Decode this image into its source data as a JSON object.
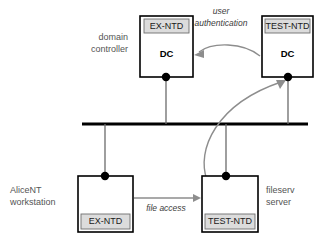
{
  "diagram": {
    "colors": {
      "band_fill": "#dcdcdc",
      "box_stroke": "#000000",
      "bus_line": "#000000",
      "arrow_gray": "#8d8d8d",
      "label_gray": "#545454",
      "background": "#ffffff"
    },
    "nodes": [
      {
        "id": "dc-left",
        "band_label": "EX-NTD",
        "role_label": "DC",
        "band_position": "top",
        "side_label": "domain controller",
        "side_label_lines": [
          "domain",
          "controller"
        ],
        "side_label_position": "left"
      },
      {
        "id": "dc-right",
        "band_label": "TEST-NTD",
        "role_label": "DC",
        "band_position": "top",
        "side_label": "",
        "side_label_lines": [],
        "side_label_position": "none"
      },
      {
        "id": "workstation",
        "band_label": "EX-NTD",
        "role_label": "",
        "band_position": "bottom",
        "side_label": "AliceNT workstation",
        "side_label_lines": [
          "AliceNT",
          "workstation"
        ],
        "side_label_position": "left"
      },
      {
        "id": "fileserver",
        "band_label": "TEST-NTD",
        "role_label": "",
        "band_position": "bottom",
        "side_label": "fileserv server",
        "side_label_lines": [
          "fileserv",
          "server"
        ],
        "side_label_position": "right"
      }
    ],
    "edges": [
      {
        "id": "user-authentication",
        "label_lines": [
          "user",
          "authentication"
        ],
        "from": "dc-right",
        "to": "dc-left",
        "style": "curved-arrow"
      },
      {
        "id": "file-access",
        "label_lines": [
          "file access"
        ],
        "from": "workstation",
        "to": "fileserver",
        "style": "straight-arrow"
      },
      {
        "id": "fileserver-to-dc",
        "label_lines": [],
        "from": "fileserver",
        "to": "dc-right",
        "style": "curved-arrow"
      }
    ],
    "network_bus": {
      "label": "network backbone",
      "attached_nodes": [
        "dc-left",
        "dc-right",
        "workstation",
        "fileserver"
      ]
    }
  }
}
